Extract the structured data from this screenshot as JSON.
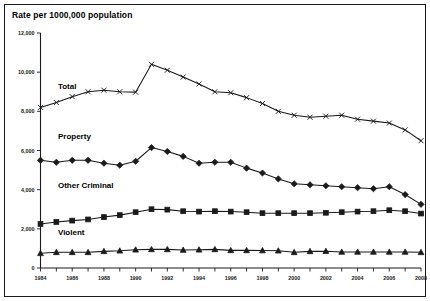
{
  "chart_data": {
    "type": "line",
    "title": "Rate per 1000,000 population",
    "xlabel": "",
    "ylabel": "",
    "xlim": [
      1984,
      2008
    ],
    "ylim": [
      0,
      12000
    ],
    "grid": false,
    "legend_position": "inline-labels",
    "x": [
      1984,
      1985,
      1986,
      1987,
      1988,
      1989,
      1990,
      1991,
      1992,
      1993,
      1994,
      1995,
      1996,
      1997,
      1998,
      1999,
      2000,
      2001,
      2002,
      2003,
      2004,
      2005,
      2006,
      2007,
      2008
    ],
    "y_ticks": [
      0,
      2000,
      4000,
      6000,
      8000,
      10000,
      12000
    ],
    "y_tick_labels": [
      "0",
      "2,000",
      "4,000",
      "6,000",
      "8,000",
      "10,000",
      "12,000"
    ],
    "x_ticks": [
      1984,
      1985,
      1986,
      1987,
      1988,
      1989,
      1990,
      1991,
      1992,
      1993,
      1994,
      1995,
      1996,
      1997,
      1998,
      1999,
      2000,
      2001,
      2002,
      2003,
      2004,
      2005,
      2006,
      2007,
      2008
    ],
    "x_tick_labels": [
      "1984",
      "",
      "1986",
      "",
      "1988",
      "",
      "1990",
      "",
      "1992",
      "",
      "1994",
      "",
      "1996",
      "",
      "1998",
      "",
      "2000",
      "",
      "2002",
      "",
      "2004",
      "",
      "2006",
      "",
      "2008"
    ],
    "series": [
      {
        "name": "Total",
        "marker": "cross",
        "label_x": 1985.1,
        "label_y": 9150,
        "values": [
          8200,
          8450,
          8750,
          9000,
          9080,
          9000,
          8980,
          10400,
          10100,
          9750,
          9400,
          9000,
          8950,
          8700,
          8400,
          8000,
          7800,
          7700,
          7750,
          7800,
          7600,
          7500,
          7400,
          7050,
          6500
        ]
      },
      {
        "name": "Property",
        "marker": "diamond",
        "label_x": 1985.1,
        "label_y": 6600,
        "values": [
          5500,
          5400,
          5500,
          5500,
          5350,
          5250,
          5450,
          6150,
          5950,
          5700,
          5350,
          5400,
          5400,
          5100,
          4850,
          4550,
          4300,
          4250,
          4200,
          4150,
          4100,
          4050,
          4150,
          3750,
          3250
        ]
      },
      {
        "name": "Other Criminal",
        "marker": "square",
        "label_x": 1985.1,
        "label_y": 4100,
        "values": [
          2250,
          2350,
          2420,
          2480,
          2600,
          2700,
          2850,
          3000,
          2980,
          2900,
          2880,
          2900,
          2880,
          2850,
          2800,
          2800,
          2800,
          2800,
          2820,
          2850,
          2880,
          2900,
          2950,
          2900,
          2780
        ]
      },
      {
        "name": "Violent",
        "marker": "triangle",
        "label_x": 1985.1,
        "label_y": 1700,
        "values": [
          750,
          800,
          800,
          800,
          850,
          880,
          930,
          950,
          950,
          920,
          930,
          950,
          900,
          900,
          890,
          880,
          800,
          850,
          860,
          820,
          820,
          820,
          820,
          820,
          800
        ]
      }
    ]
  }
}
